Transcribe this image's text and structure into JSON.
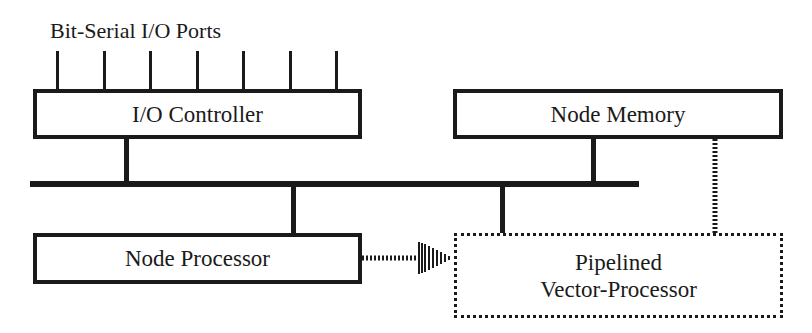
{
  "diagram": {
    "title": "Bit-Serial I/O Ports",
    "components": {
      "io_controller": "I/O Controller",
      "node_memory": "Node Memory",
      "node_processor": "Node Processor",
      "vector_processor_line1": "Pipelined",
      "vector_processor_line2": "Vector-Processor"
    },
    "port_count": 7,
    "connections": [
      {
        "from": "I/O Controller",
        "to": "bus",
        "style": "solid"
      },
      {
        "from": "Node Memory",
        "to": "bus",
        "style": "solid"
      },
      {
        "from": "Node Processor",
        "to": "bus",
        "style": "solid"
      },
      {
        "from": "Pipelined Vector-Processor",
        "to": "bus",
        "style": "solid"
      },
      {
        "from": "Node Processor",
        "to": "Pipelined Vector-Processor",
        "style": "dotted-arrow"
      },
      {
        "from": "Node Memory",
        "to": "Pipelined Vector-Processor",
        "style": "dotted"
      }
    ],
    "colors": {
      "ink": "#1a1a1a",
      "background": "#ffffff"
    }
  }
}
